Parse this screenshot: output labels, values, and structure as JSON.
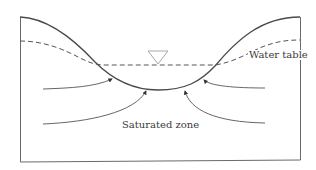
{
  "diagram": {
    "labels": {
      "water_table": "Water table",
      "saturated_zone": "Saturated zone"
    },
    "colors": {
      "ground_line": "#4a4a4a",
      "water_table_line": "#555555",
      "frame": "#6a6a6a",
      "flow_arrows": "#555555",
      "water_symbol": "#a8a8a8",
      "text": "#3a3a3a"
    },
    "elements": {
      "ground_surface": "solid curved line forming a valley",
      "water_table": "dashed curved line",
      "water_level_symbol": "inverted triangle",
      "flow_lines": 4
    }
  }
}
